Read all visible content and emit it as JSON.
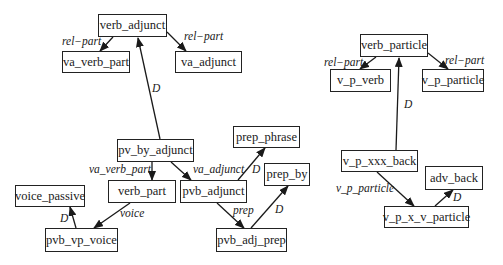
{
  "diagram": {
    "nodes": {
      "verb_adjunct": "verb_adjunct",
      "va_verb_part": "va_verb_part",
      "va_adjunct": "va_adjunct",
      "pv_by_adjunct": "pv_by_adjunct",
      "verb_part": "verb_part",
      "pvb_adjunct": "pvb_adjunct",
      "prep_phrase": "prep_phrase",
      "prep_by": "prep_by",
      "pvb_adj_prep": "pvb_adj_prep",
      "voice_passive": "voice_passive",
      "pvb_vp_voice": "pvb_vp_voice",
      "verb_particle": "verb_particle",
      "v_p_verb": "v_p_verb",
      "v_p_particle": "v_p_particle",
      "v_p_xxx_back": "v_p_xxx_back",
      "adv_back": "adv_back",
      "v_p_x_v_particle": "v_p_x_v_particle"
    },
    "edge_labels": {
      "va_to_va_verb_part": "rel−part",
      "va_to_va_adjunct": "rel−part",
      "pvby_to_va": "D",
      "pvby_to_verb_part": "va_verb_part",
      "pvby_to_pvb_adjunct": "va_adjunct",
      "pvb_adjunct_to_prep_phrase": "D",
      "pvb_adjunct_to_pvb_adj_prep": "prep",
      "pvb_adj_prep_to_prep_by": "D",
      "verb_part_to_pvb_vp_voice": "voice",
      "pvb_vp_voice_to_voice_passive": "D",
      "vp_to_v_p_verb": "rel−part",
      "vp_to_v_p_particle": "rel−part",
      "xxx_to_verb_particle": "D",
      "xxx_to_vpxv": "v_p_particle",
      "vpxv_to_adv_back": "D"
    }
  }
}
